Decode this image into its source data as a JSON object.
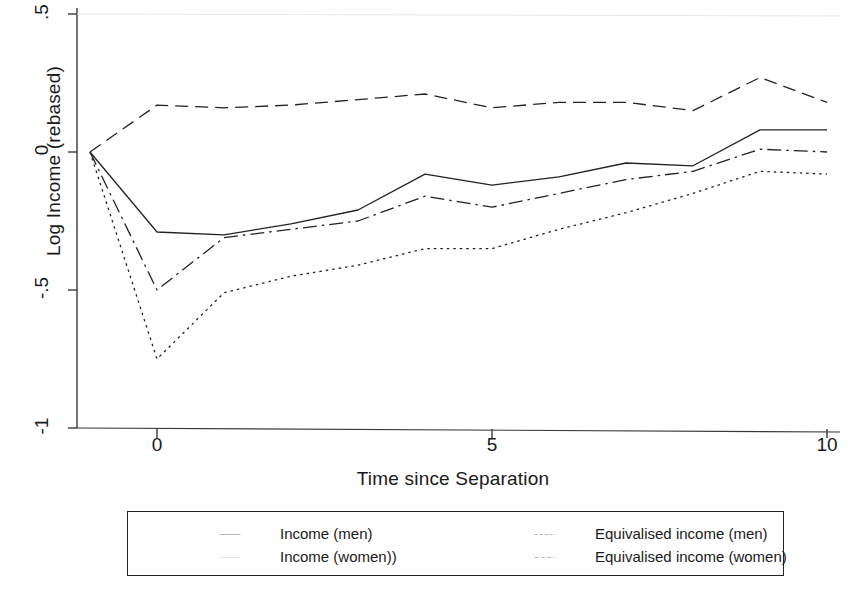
{
  "chart_data": {
    "type": "line",
    "title": "",
    "xlabel": "Time since Separation",
    "ylabel": "Log Income (rebased)",
    "xlim": [
      -1,
      10
    ],
    "ylim": [
      -1,
      0.5
    ],
    "xticks": [
      "0",
      "5",
      "10"
    ],
    "xtick_values": [
      0,
      5,
      10
    ],
    "yticks": [
      ".5",
      "0",
      "-.5",
      "-1"
    ],
    "ytick_values": [
      0.5,
      0,
      -0.5,
      -1
    ],
    "grid": false,
    "legend_position": "below",
    "x": [
      -1,
      0,
      1,
      2,
      3,
      4,
      5,
      6,
      7,
      8,
      9,
      10
    ],
    "series": [
      {
        "name": "Income (men)",
        "style": "solid",
        "color": "#222222",
        "values": [
          0,
          -0.29,
          -0.3,
          -0.26,
          -0.21,
          -0.08,
          -0.12,
          -0.09,
          -0.04,
          -0.05,
          0.08,
          0.08
        ]
      },
      {
        "name": "Income (women))",
        "style": "dotted",
        "color": "#222222",
        "values": [
          0,
          -0.75,
          -0.51,
          -0.45,
          -0.41,
          -0.35,
          -0.35,
          -0.28,
          -0.22,
          -0.15,
          -0.07,
          -0.08
        ]
      },
      {
        "name": "Equivalised income (men)",
        "style": "dashed",
        "color": "#222222",
        "values": [
          0,
          0.17,
          0.16,
          0.17,
          0.19,
          0.21,
          0.16,
          0.18,
          0.18,
          0.15,
          0.27,
          0.18
        ]
      },
      {
        "name": "Equivalised income (women)",
        "style": "dashdot",
        "color": "#222222",
        "values": [
          0,
          -0.5,
          -0.31,
          -0.28,
          -0.25,
          -0.16,
          -0.2,
          -0.15,
          -0.1,
          -0.07,
          0.01,
          0.0
        ]
      }
    ]
  },
  "legend": {
    "entries": [
      {
        "label": "Income (men)",
        "style": "solid"
      },
      {
        "label": "Equivalised income (men)",
        "style": "dashed"
      },
      {
        "label": "Income (women))",
        "style": "dotted"
      },
      {
        "label": "Equivalised income (women)",
        "style": "dashdot"
      }
    ]
  },
  "axes": {
    "line_color": "#3a3a3a"
  }
}
